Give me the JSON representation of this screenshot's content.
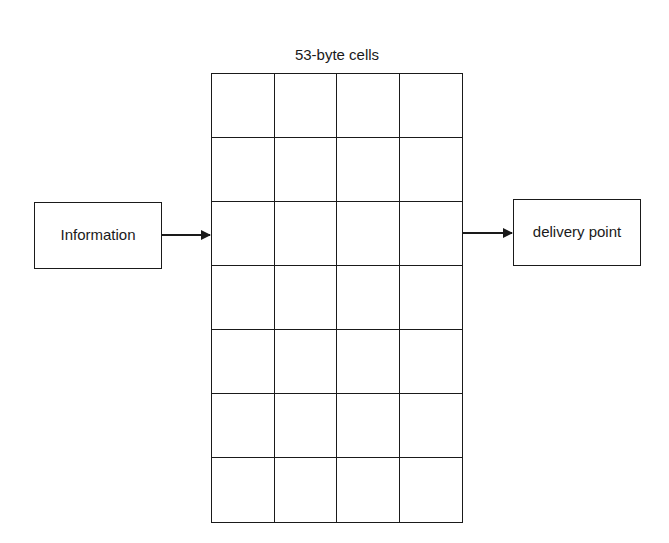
{
  "diagram": {
    "title": "53-byte cells",
    "grid": {
      "rows": 7,
      "columns": 4
    },
    "source_box": {
      "label": "Information"
    },
    "destination_box": {
      "label": "delivery point"
    },
    "edges": [
      {
        "from": "Information",
        "to": "53-byte cells"
      },
      {
        "from": "53-byte cells",
        "to": "delivery point"
      }
    ],
    "colors": {
      "stroke": "#1a1a1a",
      "background": "#ffffff"
    }
  }
}
